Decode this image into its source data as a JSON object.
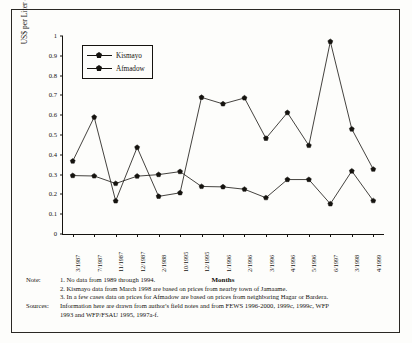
{
  "figure": {
    "y_axis_title": "US$ per Liter of Camel Milk",
    "x_axis_title": "Months"
  },
  "legend": {
    "items": [
      {
        "label": "Kismayo",
        "color": "#15130f",
        "marker": "pentagon"
      },
      {
        "label": "Afmadow",
        "color": "#15130f",
        "marker": "pentagon"
      }
    ]
  },
  "notes": {
    "note_label": "Note:",
    "items": [
      "1. No data from 1989 through 1994.",
      "2. Kismayo data from March 1998 are based on prices from nearby town of Jamaame.",
      "3. In a few cases data on prices for Afmadow are based on prices from neighboring Hagar or Bardera."
    ],
    "sources_label": "Sources:",
    "sources_line1": "Information here are drawn from author's field notes and from FEWS 1996-2000, 1999c, 1999c, WFP",
    "sources_line2": "1993 and WFP/FSAU 1995, 1997a-f."
  },
  "chart_data": {
    "type": "line",
    "title": "",
    "xlabel": "Months",
    "ylabel": "US$ per Liter of Camel Milk",
    "ylim": [
      0,
      1
    ],
    "ytick_values": [
      0,
      0.1,
      0.2,
      0.3,
      0.4,
      0.5,
      0.6,
      0.7,
      0.8,
      0.9,
      1
    ],
    "ytick_labels": [
      "0",
      "0.1",
      "0.2",
      "0.3",
      "0.4",
      "0.5",
      "0.6",
      "0.7",
      "0.8",
      "0.9",
      "1"
    ],
    "grid": false,
    "legend_position": "top-left-inside",
    "categories": [
      "3/1987",
      "7/1987",
      "11/1987",
      "12/1987",
      "2/1988",
      "10/1995",
      "12/1995",
      "1/1996",
      "2/1996",
      "3/1996",
      "4/1996",
      "5/1996",
      "6/1997",
      "3/1998",
      "4/1999"
    ],
    "series": [
      {
        "name": "Kismayo",
        "values": [
          0.295,
          0.293,
          0.255,
          0.292,
          0.3,
          0.315,
          0.24,
          0.238,
          0.226,
          0.183,
          0.275,
          0.275,
          0.152,
          0.318,
          0.168
        ]
      },
      {
        "name": "Afmadow",
        "values": [
          0.368,
          0.59,
          0.167,
          0.437,
          0.19,
          0.208,
          0.69,
          0.657,
          0.687,
          0.483,
          0.613,
          0.447,
          0.972,
          0.53,
          0.327
        ]
      }
    ]
  }
}
